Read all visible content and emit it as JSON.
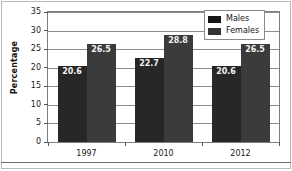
{
  "chart_data": {
    "type": "bar",
    "title": "",
    "xlabel": "",
    "ylabel": "Percentage",
    "categories": [
      "1997",
      "2010",
      "2012"
    ],
    "series": [
      {
        "name": "Males",
        "values": [
          20.6,
          22.7,
          20.6
        ],
        "color": "#272727"
      },
      {
        "name": "Females",
        "values": [
          26.5,
          28.8,
          26.5
        ],
        "color": "#3b3b3b"
      }
    ],
    "ylim": [
      0,
      35
    ],
    "yticks": [
      0,
      5,
      10,
      15,
      20,
      25,
      30,
      35
    ],
    "ytick_labels": [
      "0",
      "5",
      "10",
      "15",
      "20",
      "25",
      "30",
      "35"
    ],
    "data_labels": [
      [
        "20.6",
        "26.5"
      ],
      [
        "22.7",
        "28.8"
      ],
      [
        "20.6",
        "26.5"
      ]
    ],
    "grid": "horizontal",
    "legend_position": "top-right",
    "legend_entries": [
      "Males",
      "Females"
    ]
  },
  "axis": {
    "y_title": "Percentage"
  },
  "legend": {
    "items": [
      {
        "label": "Males"
      },
      {
        "label": "Females"
      }
    ]
  }
}
